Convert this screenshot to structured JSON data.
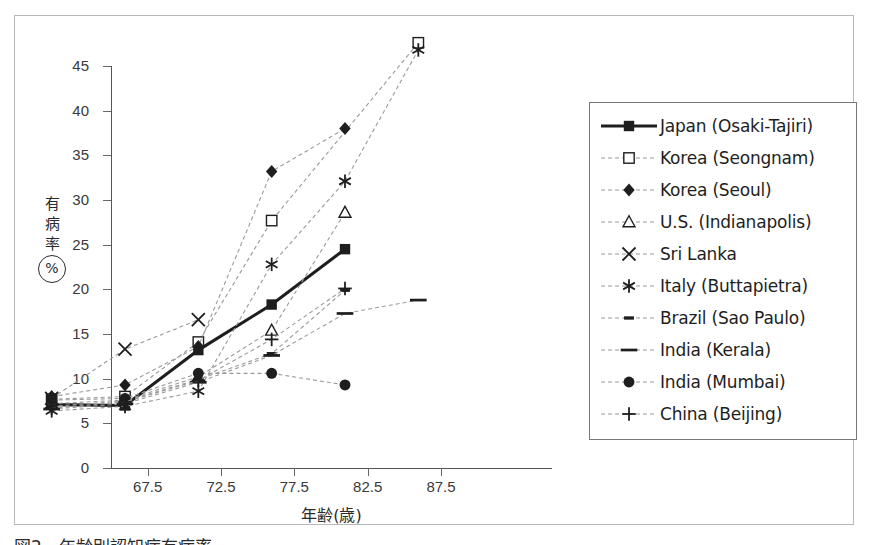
{
  "figure": {
    "caption": "図2　年齢別認知症有病率",
    "ylabel_chars": [
      "有",
      "病",
      "率"
    ],
    "ylabel_unit": "%",
    "xlabel": "年齢(歳)"
  },
  "chart_data": {
    "type": "line",
    "title": "",
    "xlabel": "年齢(歳)",
    "ylabel": "有病率(%)",
    "xlim": [
      65,
      95
    ],
    "ylim": [
      0,
      45
    ],
    "x_tick_labels": [
      "67.5",
      "72.5",
      "77.5",
      "82.5",
      "87.5"
    ],
    "x_ticks": [
      67.5,
      72.5,
      77.5,
      82.5,
      87.5
    ],
    "y_ticks": [
      0,
      5,
      10,
      15,
      20,
      25,
      30,
      35,
      40,
      45
    ],
    "grid": false,
    "legend_position": "right-outside",
    "series": [
      {
        "name": "Japan (Osaki-Tajiri)",
        "marker": "filled-square",
        "line": "solid-thick",
        "x": [
          67.5,
          72.5,
          77.5,
          82.5,
          87.5
        ],
        "values": [
          1.5,
          1.4,
          7.6,
          12.7,
          18.9
        ]
      },
      {
        "name": "Korea (Seongnam)",
        "marker": "open-square",
        "line": "dashed",
        "x": [
          67.5,
          72.5,
          77.5,
          82.5,
          92.5
        ],
        "values": [
          2.1,
          2.4,
          8.5,
          22.1,
          42.0
        ]
      },
      {
        "name": "Korea (Seoul)",
        "marker": "filled-diamond",
        "line": "dashed",
        "x": [
          67.5,
          72.5,
          77.5,
          82.5,
          87.5
        ],
        "values": [
          2.4,
          3.7,
          8.0,
          27.6,
          32.4
        ]
      },
      {
        "name": "U.S. (Indianapolis)",
        "marker": "open-triangle",
        "line": "dashed",
        "x": [
          67.5,
          72.5,
          77.5,
          82.5,
          87.5
        ],
        "values": [
          1.6,
          2.0,
          4.6,
          9.8,
          23.0
        ]
      },
      {
        "name": "Sri Lanka",
        "marker": "cross-x",
        "line": "dashed",
        "x": [
          67.5,
          72.5,
          77.5
        ],
        "values": [
          2.2,
          7.7,
          11.0
        ]
      },
      {
        "name": "Italy (Buttapietra)",
        "marker": "asterisk",
        "line": "dashed",
        "x": [
          67.5,
          72.5,
          77.5,
          82.5,
          87.5,
          92.5
        ],
        "values": [
          0.8,
          1.3,
          3.0,
          17.2,
          26.5,
          41.2
        ]
      },
      {
        "name": "Brazil (Sao Paulo)",
        "marker": "short-dash",
        "line": "dashed",
        "x": [
          67.5,
          72.5,
          77.5,
          82.5,
          87.5
        ],
        "values": [
          1.3,
          1.9,
          4.3,
          7.2,
          14.3
        ]
      },
      {
        "name": "India (Kerala)",
        "marker": "long-dash",
        "line": "dashed",
        "x": [
          67.5,
          72.5,
          77.5,
          82.5,
          87.5,
          92.5
        ],
        "values": [
          1.0,
          1.6,
          4.0,
          7.0,
          11.7,
          13.2
        ]
      },
      {
        "name": "India (Mumbai)",
        "marker": "filled-circle",
        "line": "dashed",
        "x": [
          67.5,
          72.5,
          77.5,
          82.5,
          87.5
        ],
        "values": [
          2.0,
          2.2,
          5.0,
          5.0,
          3.7
        ]
      },
      {
        "name": "China (Beijing)",
        "marker": "plus",
        "line": "dashed",
        "x": [
          67.5,
          72.5,
          77.5,
          82.5,
          87.5
        ],
        "values": [
          1.1,
          1.8,
          4.2,
          8.8,
          14.5
        ]
      }
    ]
  },
  "legend": {
    "items": [
      {
        "label": "Japan (Osaki-Tajiri)",
        "marker": "filled-square",
        "style": "solid-thick"
      },
      {
        "label": "Korea (Seongnam)",
        "marker": "open-square",
        "style": "dashed"
      },
      {
        "label": "Korea (Seoul)",
        "marker": "filled-diamond",
        "style": "dashed"
      },
      {
        "label": "U.S. (Indianapolis)",
        "marker": "open-triangle",
        "style": "dashed"
      },
      {
        "label": "Sri Lanka",
        "marker": "cross-x",
        "style": "dashed"
      },
      {
        "label": "Italy (Buttapietra)",
        "marker": "asterisk",
        "style": "dashed"
      },
      {
        "label": "Brazil (Sao Paulo)",
        "marker": "short-dash",
        "style": "dashed"
      },
      {
        "label": "India (Kerala)",
        "marker": "long-dash",
        "style": "dashed"
      },
      {
        "label": "India (Mumbai)",
        "marker": "filled-circle",
        "style": "dashed"
      },
      {
        "label": "China (Beijing)",
        "marker": "plus",
        "style": "dashed"
      }
    ]
  },
  "colors": {
    "ink": "#1e1e1e",
    "axis": "#555555",
    "dashed": "#9a9a9a",
    "frame": "#b9b9b9"
  }
}
